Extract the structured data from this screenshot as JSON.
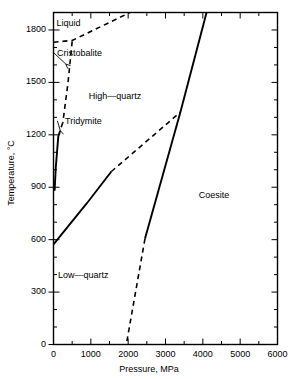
{
  "figure": {
    "type": "phase-diagram",
    "background": "#ffffff",
    "line_color": "#000000"
  },
  "axes": {
    "x": {
      "title": "Pressure, MPa",
      "min": 0,
      "max": 6000,
      "tick_labels": [
        "0",
        "1000",
        "2000",
        "3000",
        "4000",
        "5000",
        "6000"
      ],
      "tick_values": [
        0,
        1000,
        2000,
        3000,
        4000,
        5000,
        6000
      ],
      "minor_step": 500
    },
    "y": {
      "title": "Temperature, °C",
      "min": 0,
      "max": 1900,
      "tick_labels": [
        "0",
        "300",
        "600",
        "900",
        "1200",
        "1500",
        "1800"
      ],
      "tick_values": [
        0,
        300,
        600,
        900,
        1200,
        1500,
        1800
      ],
      "minor_step": 100
    }
  },
  "phase_labels": [
    {
      "name": "liquid",
      "text": "Liquid",
      "x": 400,
      "y": 1840
    },
    {
      "name": "cristobalite",
      "text": "Cristobalite",
      "x": 700,
      "y": 1670
    },
    {
      "name": "high-quartz",
      "text": "High—quartz",
      "x": 1650,
      "y": 1420
    },
    {
      "name": "tridymite",
      "text": "Tridymite",
      "x": 800,
      "y": 1280
    },
    {
      "name": "coesite",
      "text": "Coesite",
      "x": 4300,
      "y": 855
    },
    {
      "name": "low-quartz",
      "text": "Low—quartz",
      "x": 800,
      "y": 395
    }
  ],
  "chart_data": {
    "type": "line",
    "title": "",
    "xlabel": "Pressure, MPa",
    "ylabel": "Temperature, °C",
    "xlim": [
      0,
      6000
    ],
    "ylim": [
      0,
      1900
    ],
    "grid": false,
    "legend": "none",
    "series": [
      {
        "name": "liquidus (cristobalite-liquid)",
        "style": "dashed",
        "points": [
          [
            0,
            1730
          ],
          [
            500,
            1740
          ],
          [
            2050,
            1900
          ]
        ]
      },
      {
        "name": "cristobalite-high-quartz boundary",
        "style": "dashed",
        "points": [
          [
            500,
            1735
          ],
          [
            390,
            1500
          ],
          [
            250,
            1270
          ]
        ]
      },
      {
        "name": "tridymite-high-quartz boundary",
        "style": "dashed",
        "points": [
          [
            250,
            1270
          ],
          [
            130,
            1195
          ]
        ]
      },
      {
        "name": "high-quartz-tridymite/low boundary (solid)",
        "style": "solid",
        "points": [
          [
            130,
            1195
          ],
          [
            60,
            1010
          ],
          [
            30,
            880
          ]
        ]
      },
      {
        "name": "low-quartz-high-quartz boundary",
        "style": "solid",
        "points": [
          [
            0,
            573
          ],
          [
            900,
            810
          ],
          [
            1550,
            990
          ]
        ]
      },
      {
        "name": "low-quartz-high-quartz boundary extrapolation",
        "style": "dashed",
        "points": [
          [
            1550,
            990
          ],
          [
            3400,
            1330
          ]
        ]
      },
      {
        "name": "quartz-coesite boundary",
        "style": "solid",
        "points": [
          [
            3400,
            1330
          ],
          [
            4100,
            1900
          ]
        ]
      },
      {
        "name": "quartz-coesite boundary lower",
        "style": "solid",
        "points": [
          [
            3400,
            1330
          ],
          [
            2450,
            605
          ]
        ]
      },
      {
        "name": "quartz-coesite boundary extrapolation",
        "style": "dashed",
        "points": [
          [
            2450,
            605
          ],
          [
            1950,
            0
          ]
        ]
      }
    ],
    "annotations": [
      {
        "text": "Cristobalite",
        "x": 700,
        "y": 1670,
        "leader_to": [
          330,
          1605
        ]
      },
      {
        "text": "Tridymite",
        "x": 800,
        "y": 1280,
        "leader_to": [
          180,
          1225
        ]
      }
    ]
  }
}
